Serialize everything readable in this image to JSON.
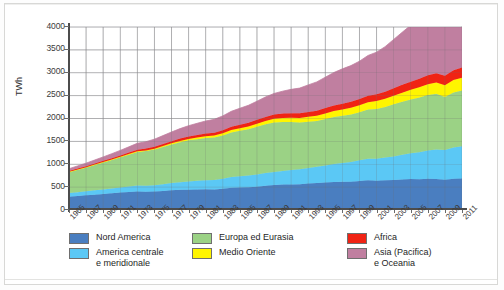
{
  "chart_data": {
    "type": "area",
    "title": "",
    "subtitle": "",
    "xlabel": "",
    "ylabel": "TWh",
    "grid": true,
    "stacked": true,
    "legend_position": "bottom",
    "ylim": [
      0,
      4000
    ],
    "ytick_values": [
      0,
      500,
      1000,
      1500,
      2000,
      2500,
      3000,
      3500,
      4000
    ],
    "ytick_labels": [
      "0",
      "500",
      "1000",
      "1500",
      "2000",
      "2500",
      "3000",
      "3500",
      "4000"
    ],
    "xlim": [
      1965,
      2011
    ],
    "xtick_labels": [
      "1965",
      "1967",
      "1969",
      "1971",
      "1973",
      "1975",
      "1977",
      "1979",
      "1981",
      "1983",
      "1985",
      "1987",
      "1989",
      "1991",
      "1993",
      "1995",
      "1997",
      "1999",
      "2001",
      "2003",
      "2005",
      "2007",
      "2009",
      "2011"
    ],
    "x": [
      1965,
      1966,
      1967,
      1968,
      1969,
      1970,
      1971,
      1972,
      1973,
      1974,
      1975,
      1976,
      1977,
      1978,
      1979,
      1980,
      1981,
      1982,
      1983,
      1984,
      1985,
      1986,
      1987,
      1988,
      1989,
      1990,
      1991,
      1992,
      1993,
      1994,
      1995,
      1996,
      1997,
      1998,
      1999,
      2000,
      2001,
      2002,
      2003,
      2004,
      2005,
      2006,
      2007,
      2008,
      2009,
      2010,
      2011
    ],
    "series": [
      {
        "name": "Nord America",
        "color": "#4a7ec0",
        "values": [
          290,
          305,
          320,
          335,
          350,
          365,
          380,
          395,
          405,
          400,
          405,
          415,
          430,
          440,
          445,
          450,
          455,
          450,
          465,
          485,
          490,
          495,
          510,
          530,
          545,
          555,
          560,
          565,
          580,
          590,
          600,
          610,
          615,
          620,
          635,
          650,
          640,
          650,
          655,
          665,
          675,
          670,
          685,
          680,
          660,
          685,
          690
        ]
      },
      {
        "name": "America centrale e meridionale",
        "color": "#5bc8f5",
        "values": [
          80,
          85,
          90,
          95,
          100,
          105,
          112,
          120,
          128,
          132,
          138,
          148,
          158,
          168,
          178,
          188,
          195,
          205,
          220,
          235,
          250,
          258,
          268,
          278,
          288,
          300,
          315,
          325,
          340,
          355,
          375,
          395,
          415,
          430,
          450,
          470,
          480,
          495,
          515,
          540,
          565,
          590,
          615,
          640,
          650,
          680,
          705
        ]
      },
      {
        "name": "Europa ed Eurasia",
        "color": "#9bd285",
        "values": [
          460,
          490,
          520,
          555,
          590,
          625,
          660,
          695,
          735,
          755,
          780,
          815,
          845,
          875,
          900,
          910,
          925,
          930,
          945,
          975,
          990,
          1010,
          1040,
          1065,
          1080,
          1070,
          1050,
          1020,
          1010,
          1000,
          1015,
          1030,
          1030,
          1040,
          1050,
          1075,
          1090,
          1105,
          1140,
          1160,
          1175,
          1200,
          1215,
          1220,
          1160,
          1205,
          1215
        ]
      },
      {
        "name": "Medio Oriente",
        "color": "#fff500",
        "values": [
          4,
          5,
          6,
          7,
          8,
          9,
          10,
          12,
          14,
          16,
          18,
          21,
          24,
          27,
          30,
          34,
          38,
          42,
          47,
          52,
          58,
          63,
          68,
          74,
          80,
          86,
          92,
          99,
          106,
          113,
          120,
          128,
          136,
          144,
          152,
          161,
          170,
          180,
          190,
          200,
          212,
          224,
          236,
          248,
          258,
          270,
          282
        ]
      },
      {
        "name": "Africa",
        "color": "#f02314",
        "values": [
          18,
          20,
          22,
          24,
          26,
          28,
          31,
          34,
          37,
          39,
          42,
          45,
          48,
          51,
          54,
          58,
          61,
          64,
          68,
          72,
          76,
          80,
          84,
          88,
          92,
          96,
          100,
          104,
          108,
          112,
          117,
          122,
          127,
          132,
          138,
          144,
          150,
          156,
          163,
          170,
          178,
          186,
          194,
          202,
          208,
          216,
          224
        ]
      },
      {
        "name": "Asia (Pacifica) e Oceania",
        "color": "#c07fa0",
        "values": [
          50,
          58,
          66,
          76,
          86,
          98,
          110,
          124,
          140,
          150,
          165,
          182,
          200,
          218,
          236,
          255,
          272,
          290,
          312,
          338,
          360,
          382,
          408,
          436,
          462,
          490,
          520,
          552,
          590,
          630,
          675,
          720,
          762,
          790,
          828,
          878,
          920,
          985,
          1065,
          1150,
          1235,
          1330,
          1420,
          1470,
          1500,
          1595,
          1690
        ]
      }
    ]
  },
  "axis": {
    "y_title": "TWh"
  },
  "legend": {
    "columns": [
      {
        "items": [
          {
            "label": "Nord America",
            "color": "#4a7ec0",
            "swatch_name": "legend-swatch-nord-america"
          },
          {
            "label": "America centrale\ne meridionale",
            "color": "#5bc8f5",
            "swatch_name": "legend-swatch-america-centrale-e-meridionale"
          }
        ]
      },
      {
        "items": [
          {
            "label": "Europa ed Eurasia",
            "color": "#9bd285",
            "swatch_name": "legend-swatch-europa-ed-eurasia"
          },
          {
            "label": "Medio Oriente",
            "color": "#fff500",
            "swatch_name": "legend-swatch-medio-oriente"
          }
        ]
      },
      {
        "items": [
          {
            "label": "Africa",
            "color": "#f02314",
            "swatch_name": "legend-swatch-africa"
          },
          {
            "label": "Asia (Pacifica)\ne Oceania",
            "color": "#c07fa0",
            "swatch_name": "legend-swatch-asia-pacifica-e-oceania"
          }
        ]
      }
    ]
  }
}
